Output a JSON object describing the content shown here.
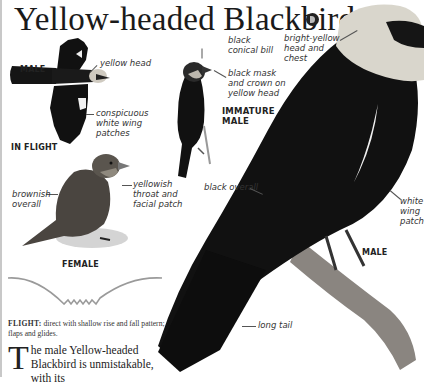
{
  "page": {
    "title": "Yellow-headed Blackbird",
    "audio_icon": "speaker-icon"
  },
  "illustrations": {
    "in_flight": {
      "sex_tag": "MALE",
      "caption": "IN FLIGHT",
      "labels": [
        "yellow head",
        "conspicuous white wing patches"
      ]
    },
    "immature_male": {
      "caption_line1": "IMMATURE",
      "caption_line2": "MALE",
      "labels": [
        "black conical bill",
        "black mask and crown on yellow head"
      ]
    },
    "female": {
      "caption": "FEMALE",
      "labels": [
        "brownish overall",
        "yellowish throat and facial patch"
      ]
    },
    "male": {
      "caption": "MALE",
      "labels": [
        "bright-yellow head and chest",
        "black overall",
        "white wing patch",
        "long tail"
      ]
    }
  },
  "label_lines": {
    "yellow_head": "yellow head",
    "wing_patches_1": "conspicuous",
    "wing_patches_2": "white wing",
    "wing_patches_3": "patches",
    "bill_1": "black",
    "bill_2": "conical bill",
    "mask_1": "black mask",
    "mask_2": "and crown on",
    "mask_3": "yellow head",
    "brownish_1": "brownish",
    "brownish_2": "overall",
    "throat_1": "yellowish",
    "throat_2": "throat and",
    "throat_3": "facial patch",
    "bright_1": "bright-yellow",
    "bright_2": "head and",
    "bright_3": "chest",
    "black_overall": "black overall",
    "white_patch_1": "white",
    "white_patch_2": "wing",
    "white_patch_3": "patch",
    "long_tail": "long tail"
  },
  "flight": {
    "heading": "FLIGHT:",
    "description": "direct with shallow rise and fall pattern; flaps and glides."
  },
  "body": {
    "dropcap": "T",
    "text": "he male Yellow-headed Blackbird is unmistakable, with its"
  },
  "colors": {
    "ink": "#1a1a1a",
    "bird_black": "#111111",
    "head_pale": "#d9d6cc",
    "female_brown": "#4a4540"
  }
}
